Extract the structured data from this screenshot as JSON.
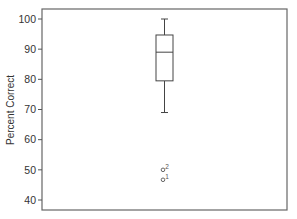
{
  "chart_data": {
    "type": "box",
    "title": "",
    "xlabel": "",
    "ylabel": "Percent Correct",
    "ylim": [
      37,
      102
    ],
    "yticks": [
      40,
      50,
      60,
      70,
      80,
      90,
      100
    ],
    "grid": false,
    "legend": "none",
    "boxes": [
      {
        "name": "",
        "whisker_low": 69,
        "q1": 79.5,
        "median": 89,
        "q3": 94.7,
        "whisker_high": 100,
        "outliers": [
          {
            "value": 50,
            "label": "2"
          },
          {
            "value": 46.7,
            "label": "1"
          }
        ]
      }
    ]
  }
}
